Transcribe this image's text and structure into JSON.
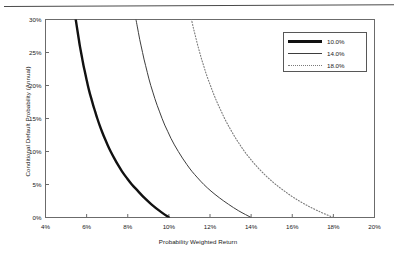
{
  "chart_data": {
    "type": "line",
    "title": "",
    "xlabel": "Probability Weighted Return",
    "ylabel": "Conditional Default Probability (Annual)",
    "xlim": [
      4,
      20
    ],
    "ylim": [
      0,
      30
    ],
    "x_ticks": [
      "4%",
      "6%",
      "8%",
      "10%",
      "12%",
      "14%",
      "16%",
      "18%",
      "20%"
    ],
    "y_ticks": [
      "0%",
      "5%",
      "10%",
      "15%",
      "20%",
      "25%",
      "30%"
    ],
    "grid": false,
    "legend_position": "top-right-inside",
    "axis_note": "x = Probability Weighted Return (percent); y = Conditional Default Probability, annual (percent)",
    "series": [
      {
        "name": "10.0%",
        "style": "thick-solid",
        "color": "#111111",
        "points": [
          {
            "x": 10.0,
            "y": 0
          },
          {
            "x": 9.55,
            "y": 1
          },
          {
            "x": 9.15,
            "y": 2
          },
          {
            "x": 8.8,
            "y": 3
          },
          {
            "x": 8.5,
            "y": 4
          },
          {
            "x": 8.2,
            "y": 5
          },
          {
            "x": 7.95,
            "y": 6
          },
          {
            "x": 7.72,
            "y": 7
          },
          {
            "x": 7.52,
            "y": 8
          },
          {
            "x": 7.34,
            "y": 9
          },
          {
            "x": 7.17,
            "y": 10
          },
          {
            "x": 7.02,
            "y": 11
          },
          {
            "x": 6.88,
            "y": 12
          },
          {
            "x": 6.75,
            "y": 13
          },
          {
            "x": 6.63,
            "y": 14
          },
          {
            "x": 6.52,
            "y": 15
          },
          {
            "x": 6.42,
            "y": 16
          },
          {
            "x": 6.32,
            "y": 17
          },
          {
            "x": 6.23,
            "y": 18
          },
          {
            "x": 6.14,
            "y": 19
          },
          {
            "x": 6.06,
            "y": 20
          },
          {
            "x": 5.99,
            "y": 21
          },
          {
            "x": 5.92,
            "y": 22
          },
          {
            "x": 5.85,
            "y": 23
          },
          {
            "x": 5.79,
            "y": 24
          },
          {
            "x": 5.73,
            "y": 25
          },
          {
            "x": 5.67,
            "y": 26
          },
          {
            "x": 5.62,
            "y": 27
          },
          {
            "x": 5.57,
            "y": 28
          },
          {
            "x": 5.52,
            "y": 29
          },
          {
            "x": 5.47,
            "y": 30
          }
        ]
      },
      {
        "name": "14.0%",
        "style": "thin-solid",
        "color": "#3d3d3d",
        "points": [
          {
            "x": 14.0,
            "y": 0
          },
          {
            "x": 13.4,
            "y": 1
          },
          {
            "x": 12.9,
            "y": 2
          },
          {
            "x": 12.45,
            "y": 3
          },
          {
            "x": 12.05,
            "y": 4
          },
          {
            "x": 11.7,
            "y": 5
          },
          {
            "x": 11.4,
            "y": 6
          },
          {
            "x": 11.12,
            "y": 7
          },
          {
            "x": 10.88,
            "y": 8
          },
          {
            "x": 10.66,
            "y": 9
          },
          {
            "x": 10.46,
            "y": 10
          },
          {
            "x": 10.27,
            "y": 11
          },
          {
            "x": 10.1,
            "y": 12
          },
          {
            "x": 9.95,
            "y": 13
          },
          {
            "x": 9.8,
            "y": 14
          },
          {
            "x": 9.67,
            "y": 15
          },
          {
            "x": 9.55,
            "y": 16
          },
          {
            "x": 9.43,
            "y": 17
          },
          {
            "x": 9.32,
            "y": 18
          },
          {
            "x": 9.22,
            "y": 19
          },
          {
            "x": 9.12,
            "y": 20
          },
          {
            "x": 9.03,
            "y": 21
          },
          {
            "x": 8.95,
            "y": 22
          },
          {
            "x": 8.87,
            "y": 23
          },
          {
            "x": 8.79,
            "y": 24
          },
          {
            "x": 8.72,
            "y": 25
          },
          {
            "x": 8.65,
            "y": 26
          },
          {
            "x": 8.58,
            "y": 27
          },
          {
            "x": 8.52,
            "y": 28
          },
          {
            "x": 8.46,
            "y": 29
          },
          {
            "x": 8.4,
            "y": 30
          }
        ]
      },
      {
        "name": "18.0%",
        "style": "dotted",
        "color": "#7a7a7a",
        "points": [
          {
            "x": 18.0,
            "y": 0
          },
          {
            "x": 17.25,
            "y": 1
          },
          {
            "x": 16.62,
            "y": 2
          },
          {
            "x": 16.08,
            "y": 3
          },
          {
            "x": 15.62,
            "y": 4
          },
          {
            "x": 15.2,
            "y": 5
          },
          {
            "x": 14.83,
            "y": 6
          },
          {
            "x": 14.5,
            "y": 7
          },
          {
            "x": 14.2,
            "y": 8
          },
          {
            "x": 13.93,
            "y": 9
          },
          {
            "x": 13.68,
            "y": 10
          },
          {
            "x": 13.46,
            "y": 11
          },
          {
            "x": 13.25,
            "y": 12
          },
          {
            "x": 13.06,
            "y": 13
          },
          {
            "x": 12.88,
            "y": 14
          },
          {
            "x": 12.71,
            "y": 15
          },
          {
            "x": 12.56,
            "y": 16
          },
          {
            "x": 12.41,
            "y": 17
          },
          {
            "x": 12.27,
            "y": 18
          },
          {
            "x": 12.14,
            "y": 19
          },
          {
            "x": 12.02,
            "y": 20
          },
          {
            "x": 11.9,
            "y": 21
          },
          {
            "x": 11.79,
            "y": 22
          },
          {
            "x": 11.69,
            "y": 23
          },
          {
            "x": 11.59,
            "y": 24
          },
          {
            "x": 11.5,
            "y": 25
          },
          {
            "x": 11.41,
            "y": 26
          },
          {
            "x": 11.33,
            "y": 27
          },
          {
            "x": 11.25,
            "y": 28
          },
          {
            "x": 11.17,
            "y": 29
          },
          {
            "x": 11.1,
            "y": 30
          }
        ]
      }
    ]
  },
  "legend": {
    "items": [
      {
        "label": "10.0%",
        "swatch": "thick-solid-line-swatch"
      },
      {
        "label": "14.0%",
        "swatch": "thin-solid-line-swatch"
      },
      {
        "label": "18.0%",
        "swatch": "dotted-line-swatch"
      }
    ]
  }
}
